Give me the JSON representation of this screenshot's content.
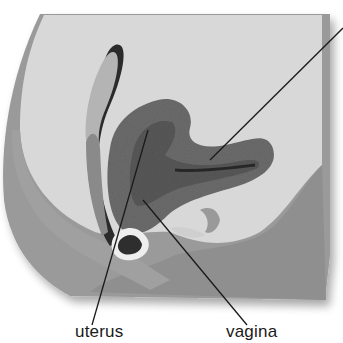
{
  "diagram": {
    "labels": [
      {
        "id": "uterus",
        "text": "uterus"
      },
      {
        "id": "vagina",
        "text": "vagina"
      }
    ],
    "offscreen_label_line": true,
    "colors": {
      "background": "#ffffff",
      "model_light": "#d6d6d6",
      "model_mid": "#a8a8a8",
      "model_dark": "#8c8c8c",
      "organ_texture": "#6e6e6e",
      "outline_dark": "#2a2a2a",
      "leader_line": "#1a1a1a"
    }
  }
}
